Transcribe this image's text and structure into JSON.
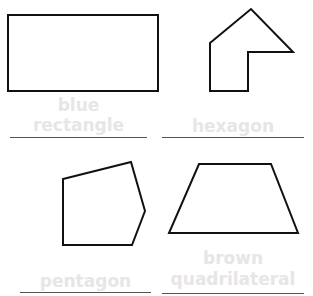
{
  "shapes": [
    {
      "name": "rectangle",
      "label_line1": "blue",
      "label_line2": "rectangle",
      "points": "8,15 158,15 158,91 8,91"
    },
    {
      "name": "hexagon",
      "label_line1": "",
      "label_line2": "hexagon",
      "points": "210,43 251,9 293,52 248,52 248,91 210,91"
    },
    {
      "name": "pentagon",
      "label_line1": "",
      "label_line2": "pentagon",
      "points": "63,179 131,162 145,211 132,245 63,245"
    },
    {
      "name": "quadrilateral",
      "label_line1": "brown",
      "label_line2": "quadrilateral",
      "points": "199,164 271,164 298,233 169,233"
    }
  ],
  "colors": {
    "stroke": "#111111",
    "label": "#e6e6e6",
    "line": "#555555"
  }
}
